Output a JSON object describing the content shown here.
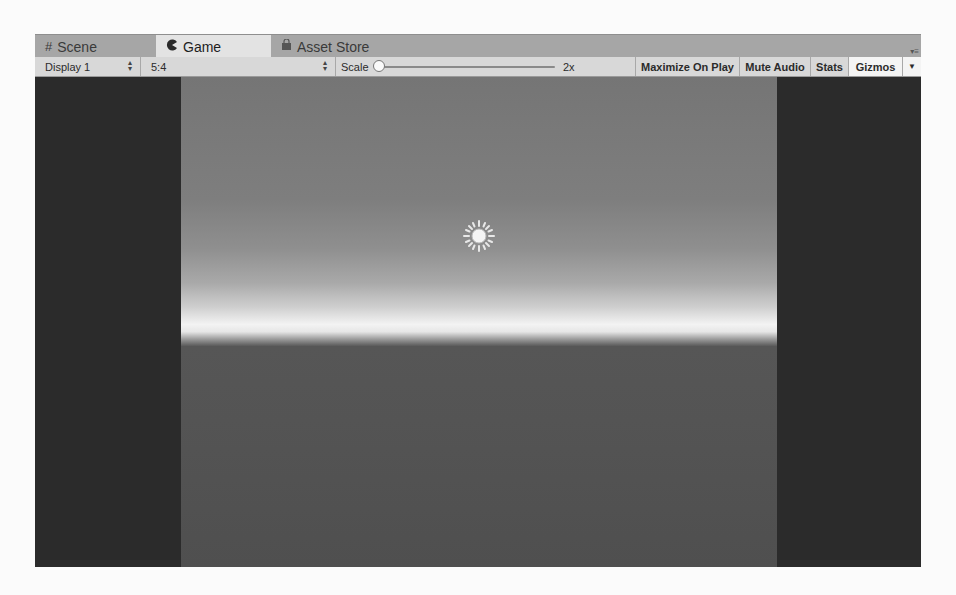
{
  "tabs": [
    {
      "label": "Scene",
      "icon": "grid-icon",
      "active": false
    },
    {
      "label": "Game",
      "icon": "pacman-icon",
      "active": true
    },
    {
      "label": "Asset Store",
      "icon": "shopping-bag-icon",
      "active": false
    }
  ],
  "tab_menu_icon": "panel-menu-icon",
  "toolbar": {
    "display": "Display 1",
    "aspect": "5:4",
    "scale_label": "Scale",
    "scale_value": "2x",
    "buttons": [
      {
        "label": "Maximize On Play",
        "active": false
      },
      {
        "label": "Mute Audio",
        "active": false
      },
      {
        "label": "Stats",
        "active": false
      },
      {
        "label": "Gizmos",
        "active": true
      }
    ],
    "gizmos_dropdown_icon": "triangle-down-icon"
  },
  "viewport": {
    "sun_icon": "directional-light-icon",
    "colors": {
      "letterbox": "#2b2b2b",
      "sky_top": "#757575",
      "horizon": "#f3f3f3",
      "ground": "#545454"
    }
  }
}
